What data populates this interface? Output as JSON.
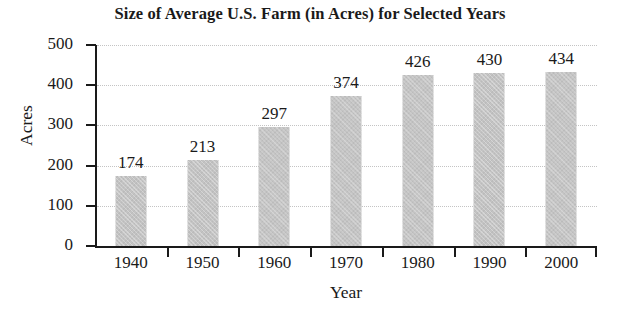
{
  "chart_data": {
    "type": "bar",
    "title": "Size of Average U.S. Farm (in Acres) for Selected Years",
    "xlabel": "Year",
    "ylabel": "Acres",
    "categories": [
      "1940",
      "1950",
      "1960",
      "1970",
      "1980",
      "1990",
      "2000"
    ],
    "values": [
      174,
      213,
      297,
      374,
      426,
      430,
      434
    ],
    "data_labels": [
      "174",
      "213",
      "297",
      "374",
      "426",
      "430",
      "434"
    ],
    "ylim": [
      0,
      500
    ],
    "ytick_labels": [
      "0",
      "100",
      "200",
      "300",
      "400",
      "500"
    ],
    "ytick_values": [
      0,
      100,
      200,
      300,
      400,
      500
    ],
    "grid": "horizontal-dotted",
    "legend": "none",
    "bar_color": "#c3c3c3",
    "axis_color": "#1a1a1a",
    "gridline_color": "#c4c4c4"
  }
}
